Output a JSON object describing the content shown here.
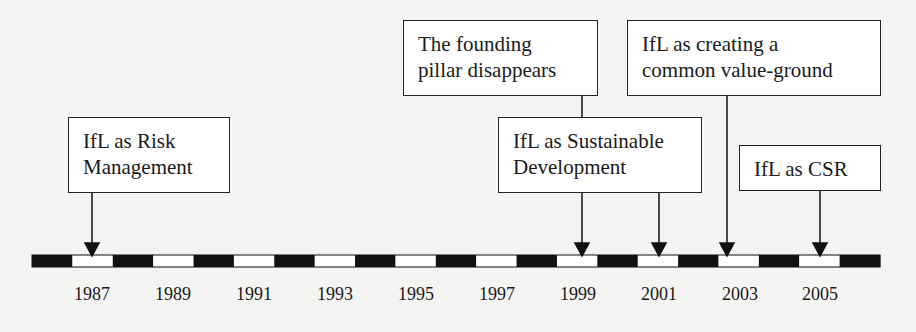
{
  "diagram": {
    "type": "timeline",
    "events": [
      {
        "id": "risk",
        "label": "IfL as Risk\nManagement",
        "year": 1987
      },
      {
        "id": "pillar",
        "label": "The founding\npillar disappears",
        "year": 1999
      },
      {
        "id": "sustainable",
        "label": "IfL as Sustainable\nDevelopment",
        "years": [
          1999,
          2001
        ]
      },
      {
        "id": "common",
        "label": "IfL as creating a\ncommon value-ground",
        "year": 2003
      },
      {
        "id": "csr",
        "label": "IfL as CSR",
        "year": 2005
      }
    ],
    "year_labels": [
      "1987",
      "1989",
      "1991",
      "1993",
      "1995",
      "1997",
      "1999",
      "2001",
      "2003",
      "2005"
    ],
    "colors": {
      "bar_dark": "#111111",
      "bar_light": "#ffffff",
      "line": "#111111",
      "background": "#f4f4f2"
    }
  }
}
